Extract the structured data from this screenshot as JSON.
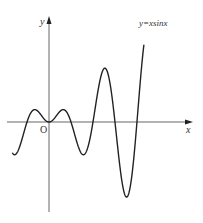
{
  "chart_data": {
    "type": "line",
    "title": "",
    "function_label": "y=xsinx",
    "xlabel": "x",
    "ylabel": "y",
    "origin_label": "O",
    "grid": false,
    "legend_position": "annotation near top-right of curve",
    "x_range": [
      -5.2,
      14.0
    ],
    "y_range": [
      -13.0,
      15.0
    ],
    "series": [
      {
        "name": "y=xsinx",
        "x": [
          -5.2,
          -4.91,
          -4.0,
          -3.14,
          -2.03,
          -1.0,
          0,
          1.0,
          2.03,
          3.14,
          4.0,
          4.91,
          6.28,
          7.98,
          9.42,
          11.09,
          12.57,
          13.6
        ],
        "values": [
          -4.59,
          -4.81,
          3.03,
          0.0,
          1.82,
          0.84,
          0.0,
          0.84,
          1.82,
          0.0,
          -3.03,
          -4.81,
          0.0,
          7.92,
          0.0,
          -11.04,
          0.0,
          11.4
        ]
      }
    ],
    "key_points": {
      "zeros": [
        -3.14,
        0,
        3.14,
        6.28,
        9.42,
        12.57
      ],
      "local_max": [
        [
          -2.03,
          1.82
        ],
        [
          2.03,
          1.82
        ],
        [
          7.98,
          7.92
        ]
      ],
      "local_min": [
        [
          0,
          0
        ],
        [
          4.91,
          -4.81
        ],
        [
          11.09,
          -11.04
        ]
      ]
    },
    "colors": {
      "curve": "#222222",
      "axis": "#555555",
      "text": "#333333",
      "background": "#ffffff"
    }
  }
}
